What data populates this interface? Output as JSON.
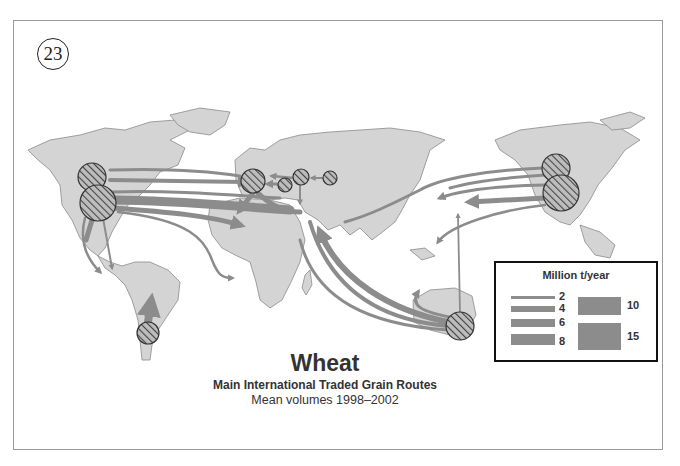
{
  "page_number": "23",
  "title": "Wheat",
  "subtitle": "Main International Traded Grain Routes",
  "period": "Mean volumes 1998–2002",
  "legend": {
    "title": "Million t/year",
    "items": [
      {
        "label": "2",
        "value": 2
      },
      {
        "label": "4",
        "value": 4
      },
      {
        "label": "6",
        "value": 6
      },
      {
        "label": "8",
        "value": 8
      },
      {
        "label": "10",
        "value": 10
      },
      {
        "label": "15",
        "value": 15
      }
    ]
  },
  "colors": {
    "land": "#d4d4d4",
    "coast": "#8a8a8a",
    "flow": "#8c8c8c",
    "exporter_hatch": "#555555",
    "frame": "#9a9a9a"
  },
  "exporters": [
    {
      "name": "Canada (west)",
      "cx": 92,
      "cy": 177,
      "r": 14
    },
    {
      "name": "USA (west)",
      "cx": 98,
      "cy": 203,
      "r": 18
    },
    {
      "name": "European Union",
      "cx": 253,
      "cy": 181,
      "r": 12
    },
    {
      "name": "Ukraine",
      "cx": 285,
      "cy": 185,
      "r": 7
    },
    {
      "name": "Russia",
      "cx": 301,
      "cy": 177,
      "r": 8
    },
    {
      "name": "Kazakhstan",
      "cx": 330,
      "cy": 178,
      "r": 7
    },
    {
      "name": "Argentina",
      "cx": 148,
      "cy": 333,
      "r": 11
    },
    {
      "name": "Australia",
      "cx": 460,
      "cy": 326,
      "r": 14
    },
    {
      "name": "Canada (east)",
      "cx": 556,
      "cy": 168,
      "r": 14
    },
    {
      "name": "USA (east)",
      "cx": 561,
      "cy": 193,
      "r": 18
    }
  ]
}
